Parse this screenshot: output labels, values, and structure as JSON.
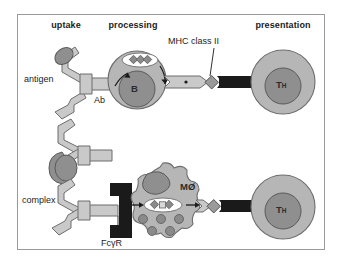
{
  "figure": {
    "border_color": "#9b9b9b",
    "background": "#ffffff"
  },
  "columns": [
    {
      "id": "uptake",
      "label": "uptake",
      "x": 66,
      "y": 20
    },
    {
      "id": "processing",
      "label": "processing",
      "x": 133,
      "y": 20
    },
    {
      "id": "presentation",
      "label": "presentation",
      "x": 283,
      "y": 20
    }
  ],
  "rows": [
    {
      "id": "b-cell-row",
      "uptake": {
        "receptor_label": "Ab",
        "receptor_label_x": 101,
        "receptor_label_y": 101,
        "ligand_label": "antigen",
        "ligand_label_x": 46,
        "ligand_label_y": 80,
        "receptor_type": "antibody-y-shape",
        "ligand_type": "antigen-oval"
      },
      "cell": {
        "name": "B",
        "name_sub": "",
        "shape": "circle",
        "cx": 137,
        "cy": 80,
        "r": 29,
        "nucleus_cx": 137,
        "nucleus_cy": 89,
        "nucleus_r": 18,
        "vesicle_peptides": 3
      },
      "presentation": {
        "mhc_label": "MHC class II",
        "mhc_label_x": 214,
        "mhc_label_y": 43,
        "mhc_pointer_from": {
          "x": 214,
          "y": 49
        },
        "mhc_pointer_to": {
          "x": 207,
          "y": 77
        },
        "tcell_name": "T",
        "tcell_name_sub": "H",
        "tcell_cx": 283,
        "tcell_cy": 82,
        "tcell_r": 32,
        "tcell_nucleus_r": 18
      }
    },
    {
      "id": "macrophage-row",
      "uptake": {
        "receptor_label": "FcγR",
        "receptor_label_x": 118,
        "receptor_label_y": 244,
        "receptor_pointer_from": {
          "x": 118,
          "y": 238
        },
        "receptor_pointer_to": {
          "x": 118,
          "y": 215
        },
        "ligand_label": "complex",
        "ligand_label_x": 47,
        "ligand_label_y": 201,
        "ligand_type": "immune-complex",
        "receptor_type": "fc-gamma-receptor"
      },
      "cell": {
        "name": "MØ",
        "name_sub": "",
        "shape": "lobed",
        "cx": 163,
        "cy": 202,
        "r": 37,
        "nucleus_cx": 153,
        "nucleus_cy": 186,
        "vesicle_peptides": 3,
        "granule_count": 7
      },
      "presentation": {
        "tcell_name": "T",
        "tcell_name_sub": "H",
        "tcell_cx": 283,
        "tcell_cy": 207,
        "tcell_r": 32,
        "tcell_nucleus_r": 18
      }
    }
  ],
  "legend_colors": {
    "cell_body": "#b3b3b3",
    "nucleus": "#8f8f8f",
    "receptor_light": "#c9c9c9",
    "antigen_dark": "#8a8a8a",
    "tcr_black": "#1a1a1a",
    "vesicle_white": "#ffffff",
    "outline": "#555555",
    "text": "#1b1b1b"
  }
}
